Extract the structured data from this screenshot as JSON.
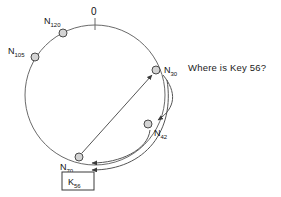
{
  "canvas": {
    "width": 281,
    "height": 197,
    "background": "#ffffff",
    "stroke_color": "#555555",
    "text_color": "#111111",
    "node_fill": "#d4d4d4",
    "node_stroke": "#4a4a4a"
  },
  "ring": {
    "origin_marker_label": "0",
    "center_x": 95,
    "center_y": 95,
    "radius": 70
  },
  "nodes": [
    {
      "id": "n120",
      "base": "N",
      "sub": "120",
      "cx": 63,
      "cy": 33,
      "label_x": 44,
      "label_y": 22
    },
    {
      "id": "n105",
      "base": "N",
      "sub": "105",
      "cx": 35,
      "cy": 57,
      "label_x": 8,
      "label_y": 52
    },
    {
      "id": "n30",
      "base": "N",
      "sub": "30",
      "cx": 156,
      "cy": 70,
      "label_x": 163,
      "label_y": 72
    },
    {
      "id": "n42",
      "base": "N",
      "sub": "42",
      "cx": 148,
      "cy": 124,
      "label_x": 153,
      "label_y": 134
    },
    {
      "id": "n70",
      "base": "N",
      "sub": "70",
      "cx": 79,
      "cy": 157,
      "label_x": 60,
      "label_y": 168
    }
  ],
  "key_box": {
    "base": "K",
    "sub": "56",
    "x": 62,
    "y": 172,
    "width": 32,
    "height": 18
  },
  "question": {
    "text": "Where is Key 56?",
    "x": 188,
    "y": 62
  },
  "arrows": [
    {
      "id": "chord-n70-to-n30",
      "from": "n70",
      "to": "n30",
      "style": "straight"
    },
    {
      "id": "arc-n30-to-n42",
      "from": "n30",
      "to": "n42",
      "style": "curved"
    },
    {
      "id": "arc-n42-to-n70",
      "from": "n42",
      "to": "n70",
      "style": "curved"
    },
    {
      "id": "arc-n30-to-n70",
      "from": "n30",
      "to": "n70",
      "style": "curved"
    }
  ]
}
